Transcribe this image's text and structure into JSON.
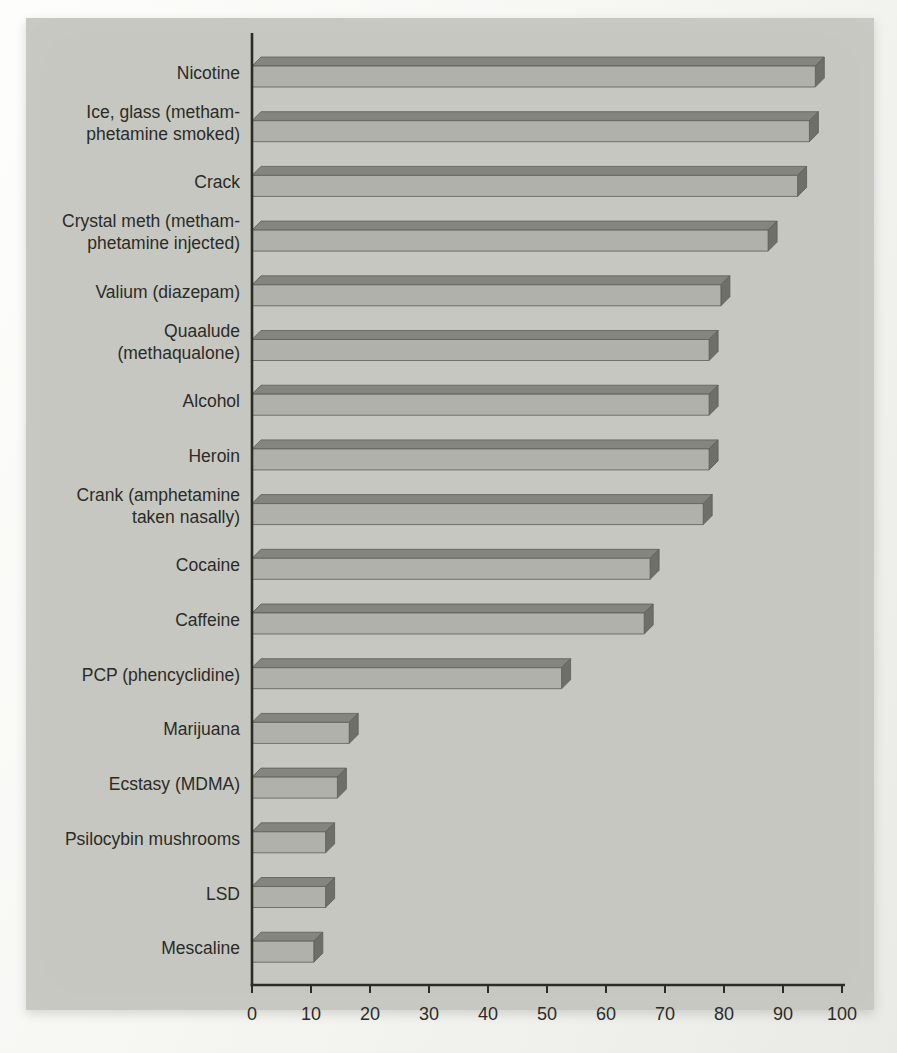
{
  "page": {
    "background_color": "#f5f5f2",
    "panel_color": "#c6c7c1"
  },
  "chart_data": {
    "type": "bar",
    "orientation": "horizontal",
    "style": "3d-beveled-bars-scanned-print",
    "title": "",
    "xlabel": "",
    "ylabel": "",
    "xlim": [
      0,
      100
    ],
    "x_ticks": [
      0,
      10,
      20,
      30,
      40,
      50,
      60,
      70,
      80,
      90,
      100
    ],
    "grid": false,
    "legend": false,
    "categories": [
      "Nicotine",
      "Ice, glass (methamphetamine smoked)",
      "Crack",
      "Crystal meth (methamphetamine injected)",
      "Valium (diazepam)",
      "Quaalude (methaqualone)",
      "Alcohol",
      "Heroin",
      "Crank (amphetamine taken nasally)",
      "Cocaine",
      "Caffeine",
      "PCP (phencyclidine)",
      "Marijuana",
      "Ecstasy (MDMA)",
      "Psilocybin mushrooms",
      "LSD",
      "Mescaline"
    ],
    "label_lines": [
      [
        "Nicotine"
      ],
      [
        "Ice, glass (metham-",
        "phetamine smoked)"
      ],
      [
        "Crack"
      ],
      [
        "Crystal meth (metham-",
        "phetamine injected)"
      ],
      [
        "Valium (diazepam)"
      ],
      [
        "Quaalude",
        "(methaqualone)"
      ],
      [
        "Alcohol"
      ],
      [
        "Heroin"
      ],
      [
        "Crank (amphetamine",
        "taken nasally)"
      ],
      [
        "Cocaine"
      ],
      [
        "Caffeine"
      ],
      [
        "PCP (phencyclidine)"
      ],
      [
        "Marijuana"
      ],
      [
        "Ecstasy (MDMA)"
      ],
      [
        "Psilocybin mushrooms"
      ],
      [
        "LSD"
      ],
      [
        "Mescaline"
      ]
    ],
    "values": [
      97,
      96,
      94,
      89,
      81,
      79,
      79,
      79,
      78,
      69,
      68,
      54,
      18,
      16,
      14,
      14,
      12
    ],
    "bar_style": {
      "front_color": "#b0b1aa",
      "top_color": "#84857e",
      "side_color": "#6e6f68",
      "outline_color": "#5d5e58"
    },
    "axis_color": "#2b2c28",
    "text_color": "#2b2c28"
  }
}
